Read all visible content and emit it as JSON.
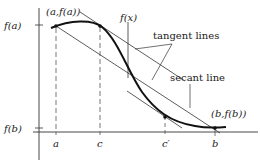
{
  "diagram": {
    "axes": {
      "y_ticks": [
        {
          "label": "f(a)",
          "y": 25
        },
        {
          "label": "f(b)",
          "y": 128
        }
      ],
      "x_ticks": [
        {
          "label": "a",
          "x": 56
        },
        {
          "label": "c",
          "x": 100
        },
        {
          "label": "c′",
          "x": 165
        },
        {
          "label": "b",
          "x": 215
        }
      ]
    },
    "labels": {
      "point_a": "(a,f(a))",
      "point_b": "(b,f(b))",
      "function": "f(x)",
      "tangent_lines": "tangent lines",
      "secant_line": "secant line"
    },
    "colors": {
      "curve": "#111111",
      "lines": "#333333",
      "dashed": "#555555"
    }
  }
}
